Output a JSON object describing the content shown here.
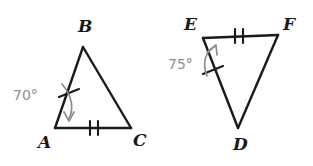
{
  "figure": {
    "background_color": "#ffffff",
    "stroke_color": "#1a1a1a",
    "angle_text_color": "#8e8e8e"
  },
  "triangles": [
    {
      "id": "triangle-abc",
      "vertices": [
        {
          "label": "B",
          "x": 83,
          "y": 47,
          "label_x": 78,
          "label_y": 18
        },
        {
          "label": "A",
          "x": 55,
          "y": 128,
          "label_x": 38,
          "label_y": 134
        },
        {
          "label": "C",
          "x": 131,
          "y": 128,
          "label_x": 133,
          "label_y": 132
        }
      ],
      "angle": {
        "vertex": "A",
        "value": "70°",
        "label_x": 13,
        "label_y": 88
      },
      "marks": [
        {
          "side": "AB",
          "ticks": 1
        },
        {
          "side": "AC",
          "ticks": 2
        }
      ]
    },
    {
      "id": "triangle-def",
      "vertices": [
        {
          "label": "E",
          "x": 203,
          "y": 38,
          "label_x": 184,
          "label_y": 16
        },
        {
          "label": "F",
          "x": 278,
          "y": 35,
          "label_x": 283,
          "label_y": 16
        },
        {
          "label": "D",
          "x": 238,
          "y": 128,
          "label_x": 233,
          "label_y": 136
        }
      ],
      "angle": {
        "vertex": "E",
        "value": "75°",
        "label_x": 168,
        "label_y": 57
      },
      "marks": [
        {
          "side": "ED",
          "ticks": 1
        },
        {
          "side": "EF",
          "ticks": 2
        }
      ]
    }
  ]
}
